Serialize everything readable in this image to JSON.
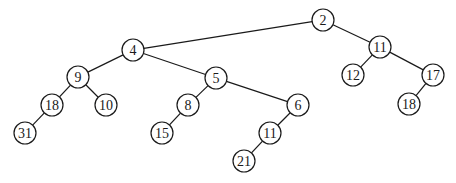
{
  "diagram": {
    "type": "tree",
    "node_radius": 11,
    "nodes": [
      {
        "id": "n2",
        "label": "2",
        "x": 323,
        "y": 20
      },
      {
        "id": "n4",
        "label": "4",
        "x": 133,
        "y": 50
      },
      {
        "id": "n11a",
        "label": "11",
        "x": 380,
        "y": 47
      },
      {
        "id": "n9",
        "label": "9",
        "x": 78,
        "y": 77
      },
      {
        "id": "n5",
        "label": "5",
        "x": 216,
        "y": 78
      },
      {
        "id": "n12",
        "label": "12",
        "x": 353,
        "y": 75
      },
      {
        "id": "n17",
        "label": "17",
        "x": 433,
        "y": 75
      },
      {
        "id": "n18a",
        "label": "18",
        "x": 52,
        "y": 105
      },
      {
        "id": "n10",
        "label": "10",
        "x": 106,
        "y": 105
      },
      {
        "id": "n8",
        "label": "8",
        "x": 188,
        "y": 105
      },
      {
        "id": "n6",
        "label": "6",
        "x": 298,
        "y": 105
      },
      {
        "id": "n18b",
        "label": "18",
        "x": 409,
        "y": 104
      },
      {
        "id": "n31",
        "label": "31",
        "x": 25,
        "y": 133
      },
      {
        "id": "n15",
        "label": "15",
        "x": 162,
        "y": 133
      },
      {
        "id": "n11b",
        "label": "11",
        "x": 270,
        "y": 133
      },
      {
        "id": "n21",
        "label": "21",
        "x": 244,
        "y": 161
      }
    ],
    "edges": [
      [
        "n2",
        "n4"
      ],
      [
        "n2",
        "n11a"
      ],
      [
        "n4",
        "n9"
      ],
      [
        "n4",
        "n5"
      ],
      [
        "n11a",
        "n12"
      ],
      [
        "n11a",
        "n17"
      ],
      [
        "n9",
        "n18a"
      ],
      [
        "n9",
        "n10"
      ],
      [
        "n5",
        "n8"
      ],
      [
        "n5",
        "n6"
      ],
      [
        "n17",
        "n18b"
      ],
      [
        "n18a",
        "n31"
      ],
      [
        "n8",
        "n15"
      ],
      [
        "n6",
        "n11b"
      ],
      [
        "n11b",
        "n21"
      ]
    ]
  }
}
